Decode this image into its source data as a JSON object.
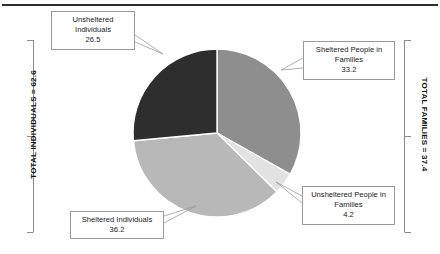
{
  "chart_data": {
    "type": "pie",
    "title": "",
    "start_angle_deg": 0,
    "direction": "clockwise",
    "unit": "thousands",
    "categories": [
      "Sheltered People in Families",
      "Unsheltered People in Families",
      "Sheltered Individuals",
      "Unsheltered Individuals"
    ],
    "values": [
      33.2,
      4.2,
      36.2,
      26.5
    ],
    "colors": [
      "#8e8e8e",
      "#e2e2e2",
      "#b8b8b8",
      "#2e2e2e"
    ],
    "slices": [
      {
        "label": "Sheltered People in Families",
        "value": 33.2,
        "color": "#8e8e8e",
        "group": "families"
      },
      {
        "label": "Unsheltered People in Families",
        "value": 4.2,
        "color": "#e2e2e2",
        "group": "families"
      },
      {
        "label": "Sheltered Individuals",
        "value": 36.2,
        "color": "#b8b8b8",
        "group": "individuals"
      },
      {
        "label": "Unsheltered Individuals",
        "value": 26.5,
        "color": "#2e2e2e",
        "group": "individuals"
      }
    ],
    "annotations": [
      {
        "text": "TOTAL INDIVIDUALS = 62.6",
        "side": "left",
        "value": 62.6
      },
      {
        "text": "TOTAL FAMILIES = 37.4",
        "side": "right",
        "value": 37.4
      }
    ],
    "legend": "none",
    "grid": false
  },
  "callouts": {
    "unsheltered_individuals": {
      "line1": "Unsheltered",
      "line2": "Individuals",
      "value": "26.5"
    },
    "sheltered_families": {
      "line1": "Sheltered People in",
      "line2": "Families",
      "value": "33.2"
    },
    "unsheltered_families": {
      "line1": "Unsheltered People",
      "line2": "in Families",
      "value": "4.2"
    },
    "sheltered_individuals": {
      "line1": "Sheltered Individuals",
      "line2": "",
      "value": "36.2"
    }
  },
  "brackets": {
    "left_label": "TOTAL INDIVIDUALS = 62.6",
    "right_label": "TOTAL FAMILIES = 37.4"
  }
}
